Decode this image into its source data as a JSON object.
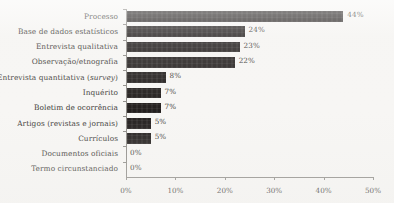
{
  "chart_data": {
    "type": "bar",
    "orientation": "horizontal",
    "title": "",
    "xlabel": "",
    "ylabel": "",
    "xlim": [
      0,
      50
    ],
    "xtick_labels": [
      "0%",
      "10%",
      "20%",
      "30%",
      "40%",
      "50%"
    ],
    "xtick_values": [
      0,
      10,
      20,
      30,
      40,
      50
    ],
    "grid": false,
    "legend": false,
    "bar_color": "#231f1e",
    "background_color": "#f7f6f4",
    "axis_color": "#8e8c88",
    "text_color": "#3c3a37",
    "categories": [
      "Processo",
      "Base de dados estatísticos",
      "Entrevista qualitativa",
      "Observação/etnografia",
      "Entrevista quantitativa (survey)",
      "Inquérito",
      "Boletim de ocorrência",
      "Artigos (revistas e jornais)",
      "Currículos",
      "Documentos oficiais",
      "Termo circunstanciado"
    ],
    "values": [
      44,
      24,
      23,
      22,
      8,
      7,
      7,
      5,
      5,
      0,
      0
    ],
    "value_labels": [
      "44%",
      "24%",
      "23%",
      "22%",
      "8%",
      "7%",
      "7%",
      "5%",
      "5%",
      "0%",
      "0%"
    ]
  },
  "labels": {
    "rows": [
      {
        "pre": "Processo",
        "em": "",
        "post": ""
      },
      {
        "pre": "Base de dados estatísticos",
        "em": "",
        "post": ""
      },
      {
        "pre": "Entrevista qualitativa",
        "em": "",
        "post": ""
      },
      {
        "pre": "Observação/etnografia",
        "em": "",
        "post": ""
      },
      {
        "pre": "Entrevista quantitativa (",
        "em": "survey",
        "post": ")"
      },
      {
        "pre": "Inquérito",
        "em": "",
        "post": ""
      },
      {
        "pre": "Boletim de ocorrência",
        "em": "",
        "post": ""
      },
      {
        "pre": "Artigos (revistas e jornais)",
        "em": "",
        "post": ""
      },
      {
        "pre": "Currículos",
        "em": "",
        "post": ""
      },
      {
        "pre": "Documentos oficiais",
        "em": "",
        "post": ""
      },
      {
        "pre": "Termo circunstanciado",
        "em": "",
        "post": ""
      }
    ]
  }
}
